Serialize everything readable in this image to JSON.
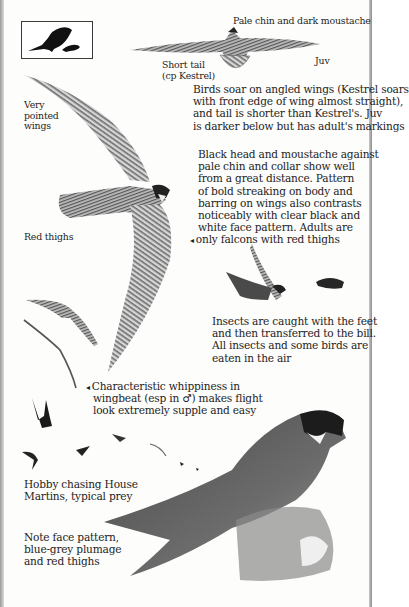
{
  "page": {
    "subject": "Hobby",
    "colors": {
      "ink": "#1d1d1d",
      "paper": "#fdfdfc",
      "plumage_dark": "#3a3a3a",
      "plumage_mid": "#7a7a7a",
      "plumage_light": "#c4c4c4",
      "silhouette": "#111111"
    }
  },
  "silhouette_box": {
    "icon": "perched-falcon-silhouette-icon"
  },
  "labels": {
    "juv_head": "Pale chin and dark moustache",
    "short_tail": "Short tail\n(cp Kestrel)",
    "juv": "Juv",
    "very_pointed": "Very\npointed\nwings",
    "red_thighs": "Red thighs"
  },
  "paragraphs": {
    "soar": "Birds soar on angled wings (Kestrel soars\nwith front edge of wing almost straight),\nand tail is shorter than Kestrel's. Juv\nis darker below but has adult's markings",
    "head": "Black head and moustache against\npale chin and collar show well\nfrom a great distance. Pattern\nof bold streaking on body and\nbarring on wings also contrasts\nnoticeably with clear black and\nwhite face pattern. Adults are",
    "head_last": "only falcons with red thighs",
    "insects": "Insects are caught with the feet\nand then transferred to the bill.\nAll insects and some birds are\neaten in the air",
    "whip_first": "Characteristic whippiness in",
    "whip_rest": "wingbeat (esp in ♂) makes flight\nlook extremely supple and easy",
    "chasing": "Hobby chasing House\nMartins, typical prey",
    "note": "Note face pattern,\nblue-grey plumage\nand red thighs"
  },
  "pointer_glyph": "◂",
  "illustrations": [
    "juvenile-soaring-falcon",
    "adult-gliding-falcon",
    "falcon-catching-insect",
    "falcon-flight-sequence",
    "hobby-chasing-martins",
    "perched-adult-hobby"
  ]
}
